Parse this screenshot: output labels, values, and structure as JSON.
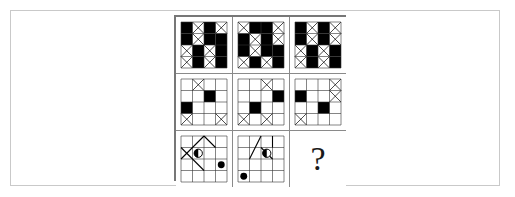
{
  "page": {
    "background_color": "#ffffff",
    "frame_border_color": "#c9c9c9",
    "grid_border_color": "#777777",
    "ink_color": "#000000"
  },
  "puzzle": {
    "type": "progressive-matrix",
    "rows": 3,
    "columns": 3,
    "inner_grid_size": 4,
    "answer_placeholder": "?",
    "cells": [
      {
        "id": "cell-1-1",
        "name": "top-left",
        "row": 1,
        "col": 1,
        "kind": "checker-diagonal",
        "filled_squares": [
          [
            0,
            0
          ],
          [
            2,
            0
          ],
          [
            0,
            1
          ],
          [
            2,
            1
          ],
          [
            3,
            1
          ],
          [
            1,
            2
          ],
          [
            3,
            2
          ],
          [
            1,
            3
          ],
          [
            3,
            3
          ]
        ],
        "diagonal_squares": [
          [
            1,
            0
          ],
          [
            3,
            0
          ],
          [
            1,
            1
          ],
          [
            0,
            2
          ],
          [
            2,
            2
          ],
          [
            0,
            3
          ],
          [
            2,
            3
          ]
        ]
      },
      {
        "id": "cell-1-2",
        "name": "top-center",
        "row": 1,
        "col": 2,
        "kind": "checker-diagonal",
        "filled_squares": [
          [
            1,
            0
          ],
          [
            2,
            0
          ],
          [
            0,
            1
          ],
          [
            2,
            1
          ],
          [
            0,
            2
          ],
          [
            2,
            2
          ],
          [
            3,
            2
          ],
          [
            1,
            3
          ],
          [
            3,
            3
          ]
        ],
        "diagonal_squares": [
          [
            0,
            0
          ],
          [
            3,
            0
          ],
          [
            1,
            1
          ],
          [
            3,
            1
          ],
          [
            1,
            2
          ],
          [
            0,
            3
          ],
          [
            2,
            3
          ]
        ]
      },
      {
        "id": "cell-1-3",
        "name": "top-right",
        "row": 1,
        "col": 3,
        "kind": "checker-diagonal",
        "filled_squares": [
          [
            0,
            0
          ],
          [
            2,
            0
          ],
          [
            0,
            1
          ],
          [
            2,
            1
          ],
          [
            1,
            2
          ],
          [
            3,
            2
          ],
          [
            1,
            3
          ],
          [
            3,
            3
          ]
        ],
        "diagonal_squares": [
          [
            1,
            0
          ],
          [
            3,
            0
          ],
          [
            1,
            1
          ],
          [
            3,
            1
          ],
          [
            0,
            2
          ],
          [
            2,
            2
          ],
          [
            0,
            3
          ],
          [
            2,
            3
          ]
        ]
      },
      {
        "id": "cell-2-1",
        "name": "middle-left",
        "row": 2,
        "col": 1,
        "kind": "sparse-diagonal",
        "filled_squares": [
          [
            2,
            1
          ],
          [
            0,
            2
          ]
        ],
        "diagonal_squares": [
          [
            1,
            0
          ],
          [
            0,
            3
          ],
          [
            3,
            3
          ]
        ]
      },
      {
        "id": "cell-2-2",
        "name": "middle-center",
        "row": 2,
        "col": 2,
        "kind": "sparse-diagonal",
        "filled_squares": [
          [
            3,
            1
          ],
          [
            1,
            2
          ]
        ],
        "diagonal_squares": [
          [
            2,
            0
          ],
          [
            0,
            3
          ],
          [
            2,
            3
          ]
        ]
      },
      {
        "id": "cell-2-3",
        "name": "middle-right",
        "row": 2,
        "col": 3,
        "kind": "sparse-diagonal",
        "filled_squares": [
          [
            0,
            1
          ],
          [
            2,
            2
          ]
        ],
        "diagonal_squares": [
          [
            3,
            0
          ],
          [
            3,
            1
          ],
          [
            0,
            3
          ]
        ]
      },
      {
        "id": "cell-3-1",
        "name": "bottom-left",
        "row": 3,
        "col": 1,
        "kind": "lines-and-circles",
        "half_circle": {
          "col": 1,
          "row": 1,
          "orientation": "left-filled"
        },
        "dot": {
          "col": 3,
          "row": 2
        },
        "lines": [
          {
            "from": [
              0,
              2
            ],
            "to": [
              2,
              0
            ]
          },
          {
            "from": [
              2,
              0
            ],
            "to": [
              3,
              1
            ]
          },
          {
            "from": [
              0,
              1
            ],
            "to": [
              2,
              3
            ]
          }
        ]
      },
      {
        "id": "cell-3-2",
        "name": "bottom-center",
        "row": 3,
        "col": 2,
        "kind": "lines-and-circles",
        "half_circle": {
          "col": 2,
          "row": 1,
          "orientation": "left-filled"
        },
        "dot": {
          "col": 0,
          "row": 3
        },
        "lines": [
          {
            "from": [
              1,
              2
            ],
            "to": [
              2,
              0
            ]
          },
          {
            "from": [
              3,
              0
            ],
            "to": [
              3,
              1
            ]
          },
          {
            "from": [
              2,
              1
            ],
            "to": [
              3,
              2
            ]
          }
        ]
      },
      {
        "id": "cell-3-3",
        "name": "answer-cell",
        "row": 3,
        "col": 3,
        "kind": "question",
        "label": "?"
      }
    ]
  }
}
